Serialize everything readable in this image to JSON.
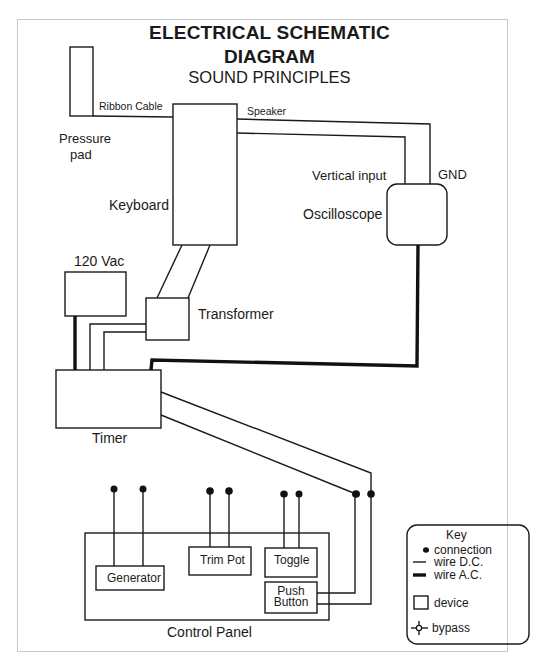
{
  "title": {
    "line1": "ELECTRICAL SCHEMATIC",
    "line2": "DIAGRAM",
    "subtitle": "SOUND PRINCIPLES"
  },
  "devices": {
    "pressure_pad": "Pressure pad",
    "pressure_pad_line1": "Pressure",
    "pressure_pad_line2": "pad",
    "keyboard": "Keyboard",
    "oscilloscope": "Oscilloscope",
    "power": "120 Vac",
    "transformer": "Transformer",
    "timer": "Timer",
    "control_panel": "Control Panel",
    "generator": "Generator",
    "trim_pot": "Trim Pot",
    "toggle": "Toggle",
    "push_button_line1": "Push",
    "push_button_line2": "Button"
  },
  "wires": {
    "ribbon_cable": "Ribbon Cable",
    "speaker": "Speaker",
    "vertical_input": "Vertical input",
    "gnd": "GND"
  },
  "key": {
    "title": "Key",
    "items": [
      {
        "symbol": "dot",
        "label": "connection"
      },
      {
        "symbol": "thin-line",
        "label": "wire D.C."
      },
      {
        "symbol": "thick-line",
        "label": "wire A.C."
      },
      {
        "symbol": "box",
        "label": "device"
      },
      {
        "symbol": "bypass",
        "label": "bypass"
      }
    ]
  },
  "colors": {
    "ink": "#1a1a1a",
    "frame": "#c8c8c8",
    "background": "#ffffff"
  }
}
